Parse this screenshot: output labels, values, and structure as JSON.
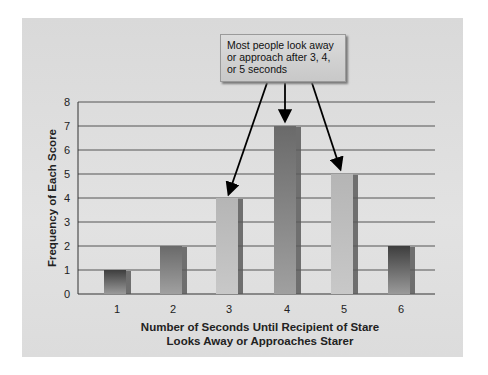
{
  "chart_data": {
    "type": "bar",
    "title": "",
    "categories": [
      "1",
      "2",
      "3",
      "4",
      "5",
      "6"
    ],
    "values": [
      1,
      2,
      4,
      7,
      5,
      2
    ],
    "xlabel": "Number of Seconds Until Recipient of Stare Looks Away or Approaches Starer",
    "xlabel_lines": [
      "Number of Seconds Until Recipient of Stare",
      "Looks Away or Approaches Starer"
    ],
    "ylabel": "Frequency of Each Score",
    "ylim": [
      0,
      8
    ],
    "yticks": [
      0,
      1,
      2,
      3,
      4,
      5,
      6,
      7,
      8
    ],
    "grid": true,
    "legend": null,
    "annotations": [
      {
        "text": "Most people look away or approach after 3, 4, or 5 seconds",
        "lines": [
          "Most people look away",
          "or approach after 3, 4,",
          "or 5 seconds"
        ],
        "points_to": [
          "3",
          "4",
          "5"
        ]
      }
    ]
  },
  "colors": {
    "panel_bg": "#dcdcdc",
    "grid": "#555555",
    "bar_dark": "#4a4a4a",
    "bar_light": "#a8a8a8",
    "arrow": "#000000"
  }
}
